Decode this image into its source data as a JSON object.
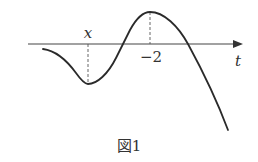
{
  "figure": {
    "caption": "図1",
    "axis_label": "t",
    "min_label": "x",
    "max_label": "−2",
    "colors": {
      "stroke": "#2a2a2a",
      "background": "#ffffff"
    }
  }
}
